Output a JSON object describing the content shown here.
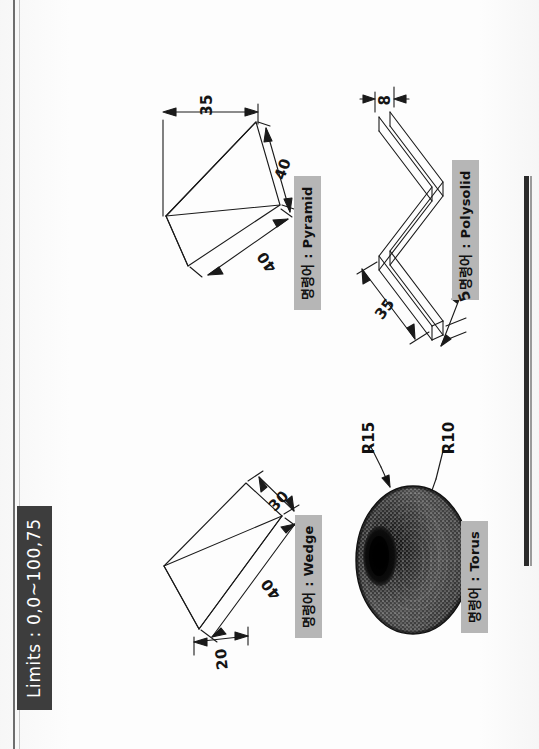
{
  "page": {
    "orientation": "rotated-90-ccw",
    "background_color": "#fdfdfd",
    "ink_color": "#151515"
  },
  "limits": {
    "label": "Limits : 0,0~100,75",
    "background_color": "#3d3d3d",
    "text_color": "#ffffff"
  },
  "chip_style": {
    "background_color": "#b6b6b6",
    "text_color": "#111111"
  },
  "figures": [
    {
      "id": "pyramid",
      "command_label": "명령어 : Pyramid",
      "shape": "pyramid",
      "dimensions": [
        {
          "value": "35",
          "kind": "linear-width"
        },
        {
          "value": "40",
          "kind": "linear-edge"
        },
        {
          "value": "40",
          "kind": "linear-edge"
        }
      ]
    },
    {
      "id": "polysolid",
      "command_label": "명령어 : Polysolid",
      "shape": "polysolid-zigzag",
      "dimensions": [
        {
          "value": "8",
          "kind": "width"
        },
        {
          "value": "35",
          "kind": "length"
        },
        {
          "value": "5",
          "kind": "thickness"
        }
      ]
    },
    {
      "id": "wedge",
      "command_label": "명령어 : Wedge",
      "shape": "wedge",
      "dimensions": [
        {
          "value": "30",
          "kind": "height"
        },
        {
          "value": "40",
          "kind": "length"
        },
        {
          "value": "20",
          "kind": "width"
        }
      ]
    },
    {
      "id": "torus",
      "command_label": "명령어 : Torus",
      "shape": "torus",
      "dimensions": [
        {
          "value": "R15",
          "kind": "torus-radius"
        },
        {
          "value": "R10",
          "kind": "tube-radius"
        }
      ]
    }
  ]
}
